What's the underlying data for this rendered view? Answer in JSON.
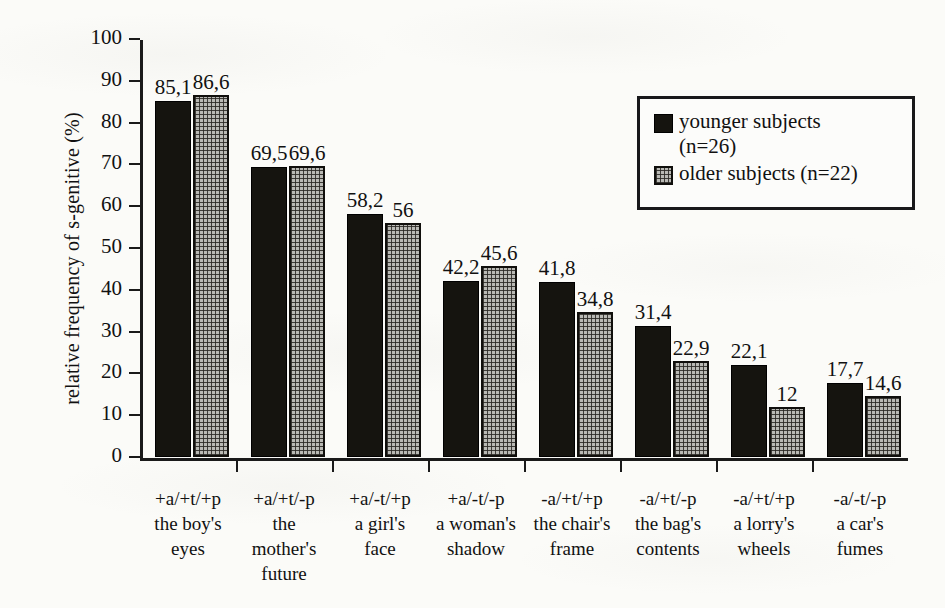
{
  "chart_data": {
    "type": "bar",
    "title": "",
    "xlabel": "",
    "ylabel": "relative frequency of s-genitive  (%)",
    "ylim": [
      0,
      100
    ],
    "yticks": [
      0,
      10,
      20,
      30,
      40,
      50,
      60,
      70,
      80,
      90,
      100
    ],
    "ytick_labels": [
      "0",
      "10",
      "20",
      "30",
      "40",
      "50",
      "60",
      "70",
      "80",
      "90",
      "100"
    ],
    "grid": false,
    "legend_position": "upper right",
    "decimal_separator": ",",
    "categories": [
      "+a/+t/+p",
      "+a/+t/-p",
      "+a/-t/+p",
      "+a/-t/-p",
      "-a/+t/+p",
      "-a/+t/-p",
      "-a/+t/+p",
      "-a/-t/-p"
    ],
    "category_examples": [
      [
        "the boy's",
        "eyes"
      ],
      [
        "the",
        "mother's",
        "future"
      ],
      [
        "a girl's",
        "face"
      ],
      [
        "a woman's",
        "shadow"
      ],
      [
        "the chair's",
        "frame"
      ],
      [
        "the bag's",
        "contents"
      ],
      [
        "a lorry's",
        "wheels"
      ],
      [
        "a car's",
        "fumes"
      ]
    ],
    "series": [
      {
        "name": "younger subjects (n=26)",
        "color": "#15140f",
        "values": [
          85.1,
          69.5,
          58.2,
          42.2,
          41.8,
          31.4,
          22.1,
          17.7
        ],
        "labels": [
          "85,1",
          "69,5",
          "58,2",
          "42,2",
          "41,8",
          "31,4",
          "22,1",
          "17,7"
        ]
      },
      {
        "name": "older subjects (n=22)",
        "color": "#b9b9b4",
        "values": [
          86.6,
          69.6,
          56,
          45.6,
          34.8,
          22.9,
          12,
          14.6
        ],
        "labels": [
          "86,6",
          "69,6",
          "56",
          "45,6",
          "34,8",
          "22,9",
          "12",
          "14,6"
        ]
      }
    ]
  },
  "legend": {
    "entries": [
      {
        "line1": "younger subjects",
        "line2": "(n=26)"
      },
      {
        "line1": "older subjects (n=22)",
        "line2": ""
      }
    ]
  }
}
